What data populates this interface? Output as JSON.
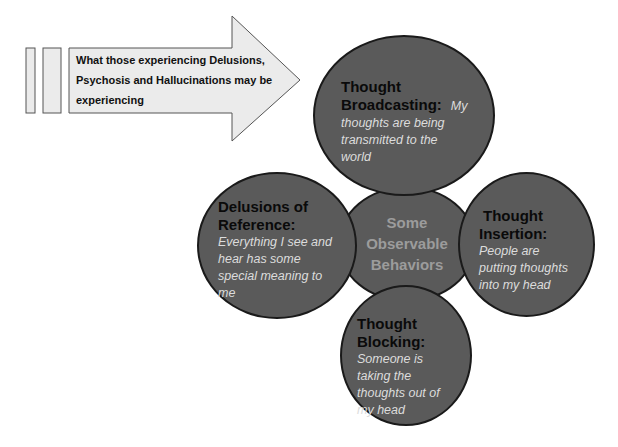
{
  "arrow": {
    "label": "What those experiencing Delusions, Psychosis and Hallucinations may be experiencing",
    "lines": [
      "What those experiencing Delusions,",
      "Psychosis and Hallucinations may be",
      "experiencing"
    ],
    "fill": "#ebebeb",
    "stroke": "#555555"
  },
  "center": {
    "lines": [
      "Some",
      "Observable",
      "Behaviors"
    ]
  },
  "circles": [
    {
      "id": "thought-broadcasting",
      "heading_lines": [
        "Thought",
        "Broadcasting:"
      ],
      "description_inline": "My",
      "description_lines": [
        "thoughts are being",
        "transmitted to the",
        "world"
      ]
    },
    {
      "id": "delusions-of-reference",
      "heading_lines": [
        "Delusions of",
        "Reference:"
      ],
      "description_lines": [
        "Everything I see and",
        "hear has some",
        "special meaning to",
        "me"
      ]
    },
    {
      "id": "thought-insertion",
      "heading_lines": [
        "Thought",
        "Insertion:"
      ],
      "description_lines": [
        "People are",
        "putting thoughts",
        "into my head"
      ]
    },
    {
      "id": "thought-blocking",
      "heading_lines": [
        "Thought",
        "Blocking:"
      ],
      "description_lines": [
        "Someone is",
        "taking the",
        "thoughts out of",
        "my head"
      ]
    }
  ],
  "colors": {
    "circle_fill": "#5a5a5a",
    "circle_stroke": "#1a1a1a",
    "heading_text": "#0a0a0a",
    "description_text": "#dcdcdc",
    "center_text": "#9c9c9c"
  }
}
